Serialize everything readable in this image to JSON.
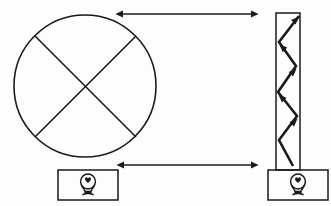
{
  "diagram": {
    "background_color": "#fdfdfc",
    "ink_color": "#1a1a1a",
    "canvas": {
      "width": 331,
      "height": 206
    },
    "left_assembly": {
      "name": "wheel-assembly",
      "wheel": {
        "shape": "circle",
        "center_x": 85,
        "center_y": 86,
        "radius": 71,
        "stroke_width": 1.6,
        "spokes": [
          {
            "name": "spoke-nw-se",
            "x1": 35,
            "y1": 36,
            "x2": 135,
            "y2": 136
          },
          {
            "name": "spoke-ne-sw",
            "x1": 135,
            "y1": 36,
            "x2": 35,
            "y2": 136
          }
        ]
      },
      "base": {
        "name": "lamp-base-left",
        "x": 58,
        "y": 170,
        "width": 60,
        "height": 30,
        "stroke_width": 1.5,
        "lamp_icon": "light-bulb-icon"
      }
    },
    "right_assembly": {
      "name": "beam-assembly",
      "beam": {
        "name": "vertical-beam",
        "x": 276,
        "y": 13,
        "width": 24,
        "height": 157,
        "stroke_width": 1.5
      },
      "zigzag": {
        "name": "zigzag-load-path",
        "description": "Upward zigzag arrow path inside the beam with four arrowheads",
        "stroke_width": 2.6,
        "points": [
          {
            "x": 293,
            "y": 166
          },
          {
            "x": 279,
            "y": 140
          },
          {
            "x": 297,
            "y": 116
          },
          {
            "x": 278,
            "y": 92
          },
          {
            "x": 296,
            "y": 66
          },
          {
            "x": 279,
            "y": 42
          },
          {
            "x": 299,
            "y": 16
          }
        ],
        "arrowhead_count": 4
      },
      "base": {
        "name": "lamp-base-right",
        "x": 268,
        "y": 170,
        "width": 60,
        "height": 30,
        "stroke_width": 1.5,
        "lamp_icon": "light-bulb-icon"
      }
    },
    "dimension_arrows": [
      {
        "name": "top-dimension-arrow",
        "orientation": "horizontal",
        "double_headed": true,
        "x1": 121,
        "x2": 253,
        "y": 14,
        "stroke_width": 1.4
      },
      {
        "name": "bottom-dimension-arrow",
        "orientation": "horizontal",
        "double_headed": true,
        "x1": 122,
        "x2": 253,
        "y": 165,
        "stroke_width": 1.4
      }
    ],
    "labels": {
      "top_arrow_label": "",
      "bottom_arrow_label": "",
      "wheel_label": "",
      "beam_label": ""
    }
  }
}
